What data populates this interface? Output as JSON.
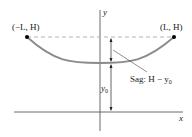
{
  "diagram": {
    "axes": {
      "x_label": "x",
      "y_label": "y"
    },
    "points": {
      "left": {
        "label": "(−L, H)"
      },
      "right": {
        "label": "(L, H)"
      }
    },
    "annotations": {
      "sag_label": "Sag: H − y",
      "sag_subscript": "0",
      "y0_label": "y",
      "y0_subscript": "0"
    },
    "colors": {
      "curve": "#8a8a8a",
      "axes": "#333333",
      "dashed": "#aaaaaa",
      "points": "#000000"
    }
  }
}
